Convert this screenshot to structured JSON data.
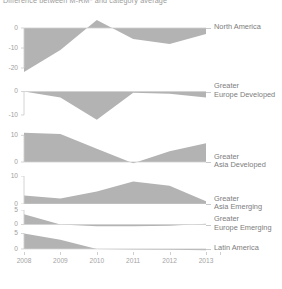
{
  "chart_data": {
    "type": "area",
    "title": "Difference between M-RM* and category average",
    "xlabel": "",
    "ylabel": "",
    "grid": false,
    "legend_position": "right",
    "x": [
      2008,
      2009,
      2010,
      2011,
      2012,
      2013
    ],
    "xtick_labels": [
      "2008",
      "2009",
      "2010",
      "2011",
      "2012",
      "2013"
    ],
    "panels": [
      {
        "name": "North America",
        "label_lines": [
          "North America"
        ],
        "values": [
          -22.0,
          -11.0,
          4.0,
          -5.5,
          -8.0,
          -3.0
        ],
        "ylim": [
          -24,
          6
        ],
        "yticks": [
          0,
          -10,
          -20
        ],
        "ytick_labels": [
          "0",
          "-10",
          "-20"
        ]
      },
      {
        "name": "Greater Europe Developed",
        "label_lines": [
          "Greater",
          "Europe Developed"
        ],
        "values": [
          0.0,
          -2.5,
          -12.0,
          -0.5,
          -1.0,
          -2.5
        ],
        "ylim": [
          -13,
          1.5
        ],
        "yticks": [
          0,
          -10
        ],
        "ytick_labels": [
          "0",
          "-10"
        ]
      },
      {
        "name": "Greater Asia Developed",
        "label_lines": [
          "Greater",
          "Asia Developed"
        ],
        "values": [
          11.0,
          10.5,
          5.0,
          -0.5,
          4.0,
          7.0
        ],
        "ylim": [
          -1.5,
          12
        ],
        "yticks": [
          10,
          0
        ],
        "ytick_labels": [
          "10",
          "0"
        ]
      },
      {
        "name": "Greater Asia Emerging",
        "label_lines": [
          "Greater",
          "Asia Emerging"
        ],
        "values": [
          3.0,
          2.0,
          4.5,
          8.0,
          6.5,
          1.0
        ],
        "ylim": [
          0,
          10
        ],
        "yticks": [
          10,
          0
        ],
        "ytick_labels": [
          "10",
          "0"
        ]
      },
      {
        "name": "Greater Europe Emerging",
        "label_lines": [
          "Greater",
          "Europe Emerging"
        ],
        "values": [
          3.5,
          0.0,
          -0.6,
          -0.6,
          -0.4,
          0.3
        ],
        "ylim": [
          -1.2,
          5
        ],
        "yticks": [
          5,
          0
        ],
        "ytick_labels": [
          "5",
          "0"
        ]
      },
      {
        "name": "Latin America",
        "label_lines": [
          "Latin America"
        ],
        "values": [
          5.0,
          3.0,
          0.0,
          -0.2,
          -0.3,
          -0.4
        ],
        "ylim": [
          -1,
          5.5
        ],
        "yticks": [
          5,
          0
        ],
        "ytick_labels": [
          "5",
          "0"
        ]
      }
    ]
  },
  "colors": {
    "area_fill": "#b3b3b3",
    "axis": "#cfcfcf",
    "text": "#8a8a8a",
    "background": "#ffffff"
  }
}
